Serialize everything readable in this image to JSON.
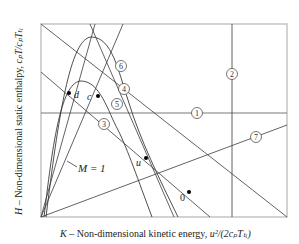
{
  "diagram": {
    "type": "enthalpy-kinetic-energy diagram",
    "x_axis_label": {
      "prefix": "K",
      "text": " – Non-dimensional kinetic energy, ",
      "formula": "u²/(2cₚTₜᵢ)"
    },
    "y_axis_label": {
      "prefix": "H",
      "text": " – Non-dimensional static enthalpy, ",
      "formula": "cₚT/cₚTₜᵢ"
    },
    "line_markers": [
      {
        "id": "1",
        "label": "1"
      },
      {
        "id": "2",
        "label": "2"
      },
      {
        "id": "3",
        "label": "3"
      },
      {
        "id": "4",
        "label": "4"
      },
      {
        "id": "5",
        "label": "5"
      },
      {
        "id": "6",
        "label": "6"
      },
      {
        "id": "7",
        "label": "7"
      }
    ],
    "points": [
      {
        "id": "c",
        "label": "c"
      },
      {
        "id": "d",
        "label": "d"
      },
      {
        "id": "u",
        "label": "u"
      },
      {
        "id": "0",
        "label": "0"
      }
    ],
    "annotation": {
      "mach_line_label": "M = 1"
    }
  }
}
